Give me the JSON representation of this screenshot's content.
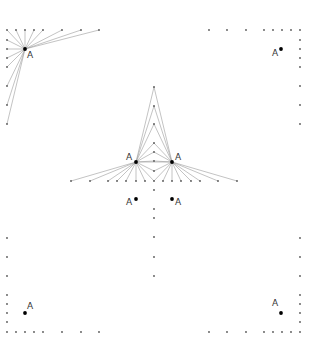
{
  "diagram": {
    "width": 315,
    "height": 350,
    "colors": {
      "line": "#9a9a9a",
      "dot": "#555555",
      "anchor": "#000000",
      "label": "#333333"
    },
    "anchors": [
      {
        "id": "tl",
        "x": 25,
        "y": 49,
        "label": "A",
        "lx": 27,
        "ly": 58
      },
      {
        "id": "tr",
        "x": 281,
        "y": 49,
        "label": "A",
        "lx": 272,
        "ly": 56
      },
      {
        "id": "cl",
        "x": 136,
        "y": 162,
        "label": "A",
        "lx": 126,
        "ly": 160
      },
      {
        "id": "cr",
        "x": 172,
        "y": 162,
        "label": "A",
        "lx": 175,
        "ly": 160
      },
      {
        "id": "ml",
        "x": 136,
        "y": 199,
        "label": "A",
        "lx": 126,
        "ly": 205
      },
      {
        "id": "mr",
        "x": 172,
        "y": 199,
        "label": "A",
        "lx": 175,
        "ly": 205
      },
      {
        "id": "bl",
        "x": 25,
        "y": 313,
        "label": "A",
        "lx": 27,
        "ly": 309
      },
      {
        "id": "br",
        "x": 281,
        "y": 313,
        "label": "A",
        "lx": 272,
        "ly": 306
      }
    ],
    "dot_groups": {
      "top_left_row": {
        "y": 30,
        "xs": [
          7,
          16,
          25,
          34,
          43,
          62,
          81,
          99
        ]
      },
      "top_left_col": {
        "x": 7,
        "ys": [
          40,
          49,
          58,
          67,
          86,
          105,
          124
        ]
      },
      "top_right_row": {
        "y": 30,
        "xs": [
          209,
          227,
          246,
          264,
          273,
          282,
          291,
          300
        ]
      },
      "top_right_col": {
        "x": 300,
        "ys": [
          40,
          49,
          58,
          67,
          86,
          105,
          124
        ]
      },
      "center_col_upper": {
        "x": 154,
        "ys": [
          87,
          106,
          124,
          143,
          152,
          161,
          171
        ]
      },
      "center_row": {
        "y": 181,
        "xs": [
          71,
          90,
          108,
          117,
          126,
          136,
          145,
          154,
          163,
          172,
          181,
          191,
          200,
          218,
          237
        ]
      },
      "center_col_lower": {
        "x": 154,
        "ys": [
          190,
          209,
          218,
          237,
          257,
          276
        ]
      },
      "bottom_left_col": {
        "x": 7,
        "ys": [
          238,
          257,
          276,
          295,
          304,
          313,
          322
        ]
      },
      "bottom_left_row": {
        "y": 332,
        "xs": [
          7,
          16,
          25,
          34,
          43,
          62,
          81,
          99
        ]
      },
      "bottom_right_col": {
        "x": 300,
        "ys": [
          238,
          257,
          276,
          295,
          304,
          313,
          322
        ]
      },
      "bottom_right_row": {
        "y": 332,
        "xs": [
          209,
          227,
          246,
          264,
          273,
          282,
          291,
          300
        ]
      }
    },
    "fans": [
      {
        "anchor": "tl",
        "groups": [
          "top_left_row",
          "top_left_col"
        ]
      },
      {
        "anchor": "cl",
        "groups": [
          "center_col_upper",
          "center_row_left"
        ]
      },
      {
        "anchor": "cr",
        "groups": [
          "center_col_upper",
          "center_row_right"
        ]
      }
    ]
  }
}
